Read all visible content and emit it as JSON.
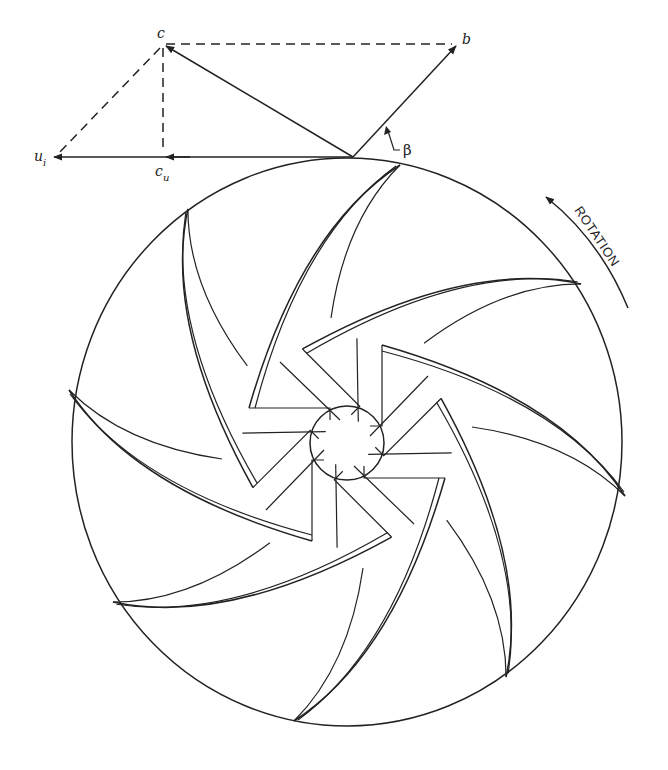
{
  "diagram": {
    "velocity_triangle": {
      "labels": {
        "c": "c",
        "b": "b",
        "u": "u",
        "u_sub": "i",
        "cu": "c",
        "cu_sub": "u",
        "beta": "β"
      }
    },
    "rotation": {
      "label": "ROTATION",
      "direction": "counter-clockwise"
    },
    "impeller": {
      "blade_count": 8,
      "splitter_count": 8,
      "has_hub": true
    },
    "colors": {
      "ink": "#222222",
      "background": "#ffffff"
    }
  }
}
